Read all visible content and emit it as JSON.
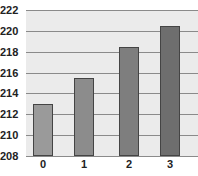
{
  "chart_data": {
    "type": "bar",
    "title": "",
    "xlabel": "",
    "ylabel": "",
    "categories": [
      "0",
      "1",
      "2",
      "3"
    ],
    "values": [
      213,
      215.5,
      218.5,
      220.5
    ],
    "ylim": [
      208,
      222
    ],
    "yticks": [
      208,
      210,
      212,
      214,
      216,
      218,
      220,
      222
    ],
    "grid": true,
    "legend": null,
    "bar_colors": [
      "#9a9a9a",
      "#8c8c8c",
      "#7e7e7e",
      "#6e6e6e"
    ]
  },
  "colors": {
    "plot_background": "#ebebeb",
    "gridline": "#8a8a8a",
    "bar_border": "#444444"
  }
}
